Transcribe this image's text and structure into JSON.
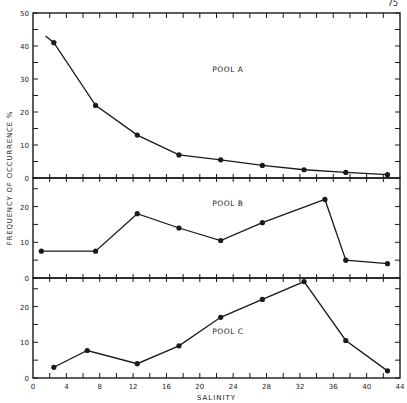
{
  "header": {
    "page_number": "75"
  },
  "chart_data": {
    "type": "line",
    "title": "",
    "xlabel": "SALINITY",
    "ylabel": "FREQUENCY OF OCCURRENCE %",
    "xlim": [
      0,
      44
    ],
    "x_ticks": [
      0,
      4,
      8,
      12,
      16,
      20,
      24,
      28,
      32,
      36,
      40,
      44
    ],
    "grid": false,
    "legend": "none",
    "panels": [
      {
        "name": "POOL A",
        "ylim": [
          0,
          50
        ],
        "y_ticks": [
          0,
          10,
          20,
          30,
          40,
          50
        ],
        "leading_line": [
          [
            1.5,
            43
          ]
        ],
        "x": [
          2.5,
          7.5,
          12.5,
          17.5,
          22.5,
          27.5,
          32.5,
          37.5,
          42.5
        ],
        "values": [
          41,
          22,
          13,
          7,
          5.5,
          3.8,
          2.5,
          1.7,
          1
        ]
      },
      {
        "name": "POOL B",
        "ylim": [
          0,
          28
        ],
        "y_ticks": [
          0,
          10,
          20
        ],
        "x": [
          1,
          7.5,
          12.5,
          17.5,
          22.5,
          27.5,
          35,
          37.5,
          42.5
        ],
        "values": [
          7.5,
          7.5,
          18,
          14,
          10.5,
          15.5,
          22,
          5,
          4
        ]
      },
      {
        "name": "POOL C",
        "ylim": [
          0,
          28
        ],
        "y_ticks": [
          0,
          10,
          20
        ],
        "x": [
          2.5,
          6.5,
          12.5,
          17.5,
          22.5,
          27.5,
          32.5,
          37.5,
          42.5
        ],
        "values": [
          3,
          7.7,
          4,
          9,
          17,
          22,
          27,
          10.5,
          2
        ]
      }
    ]
  }
}
